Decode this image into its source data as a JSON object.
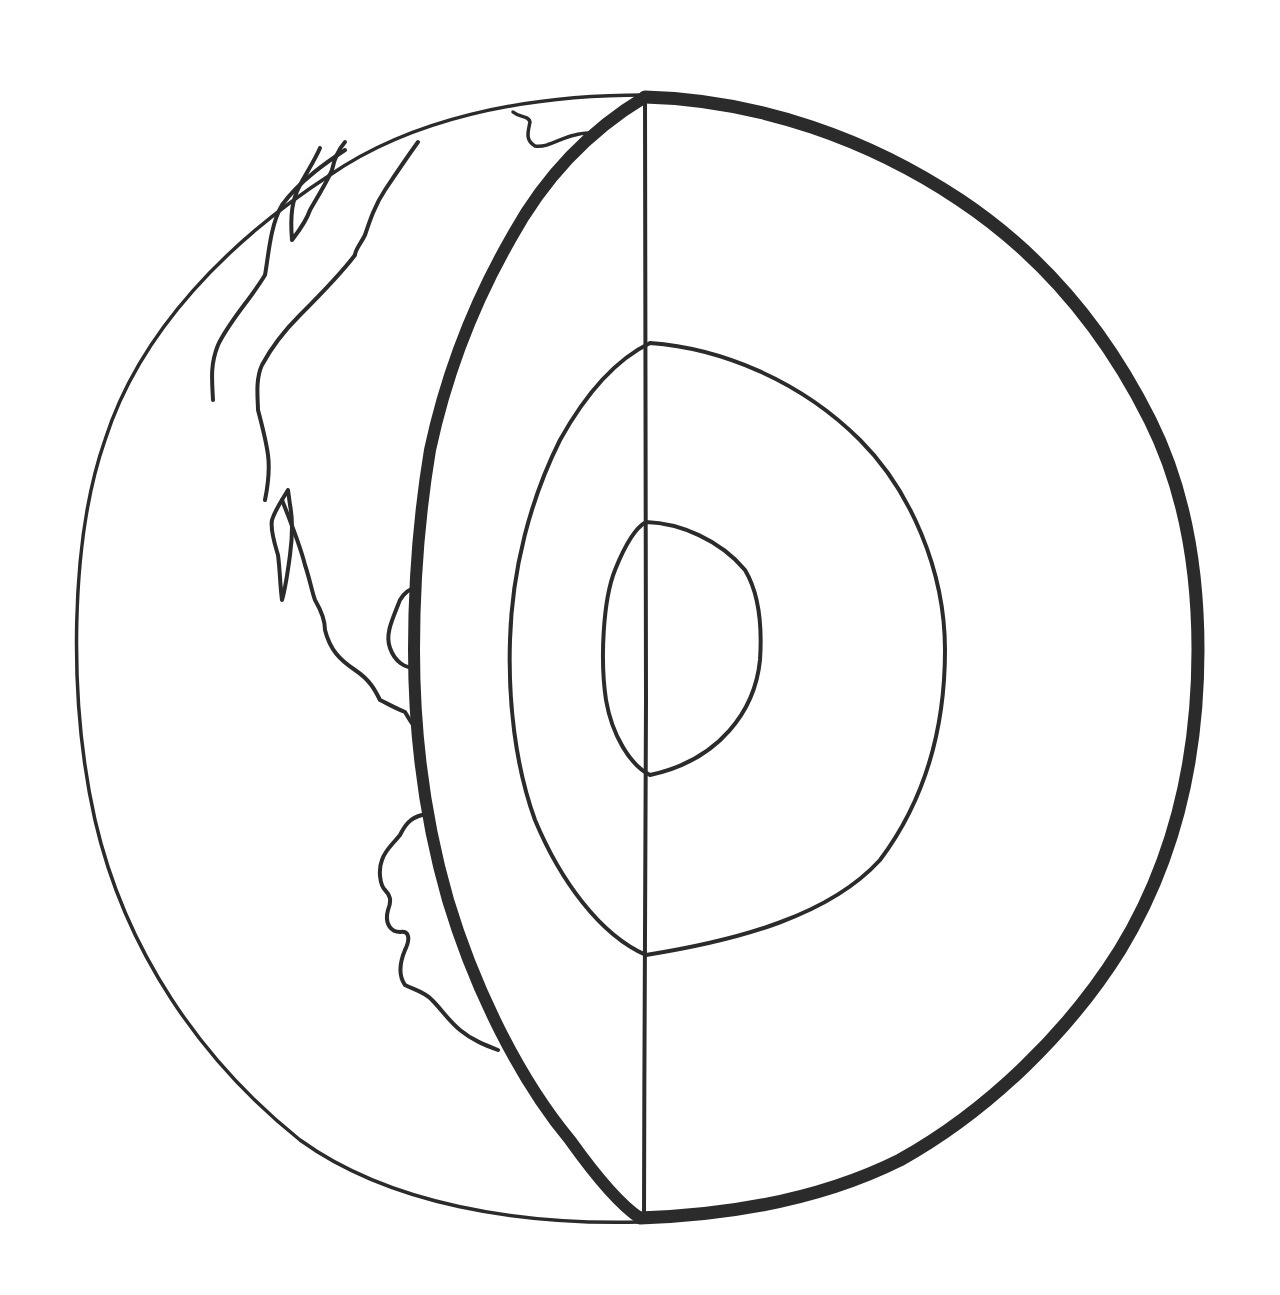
{
  "diagram": {
    "style": "hand-drawn line art",
    "colors": {
      "background": "#ffffff",
      "ink": "#2b2b2b"
    },
    "elements": [
      {
        "id": "globe-outline",
        "kind": "outer sphere outline",
        "stroke": "thin"
      },
      {
        "id": "continent-coastline",
        "kind": "continent outlines on visible surface",
        "stroke": "thin"
      },
      {
        "id": "cutaway-rim",
        "kind": "crust edge of cut hemisphere",
        "stroke": "thick"
      },
      {
        "id": "cut-axis",
        "kind": "vertical axis line through cut",
        "stroke": "thin"
      },
      {
        "id": "mantle-boundary",
        "kind": "outer core boundary",
        "stroke": "thin"
      },
      {
        "id": "inner-core",
        "kind": "inner core boundary",
        "stroke": "thin"
      }
    ],
    "labels": []
  }
}
